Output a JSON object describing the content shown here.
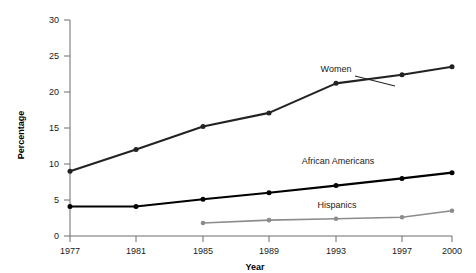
{
  "chart_data": {
    "type": "line",
    "title": "",
    "xlabel": "Year",
    "ylabel": "Percentage",
    "categories": [
      "1977",
      "1981",
      "1985",
      "1989",
      "1993",
      "1997",
      "2000"
    ],
    "x": [
      1977,
      1981,
      1985,
      1989,
      1993,
      1997,
      2000
    ],
    "xlim": [
      1977,
      2000
    ],
    "ylim": [
      0,
      30
    ],
    "yticks": [
      0,
      5,
      10,
      15,
      20,
      25,
      30
    ],
    "ytick_labels": [
      "0",
      "5",
      "10",
      "15",
      "20",
      "25",
      "30"
    ],
    "xtick_labels": [
      "1977",
      "1981",
      "1985",
      "1989",
      "1993",
      "1997",
      "2000"
    ],
    "grid": false,
    "legend_position": "inline-annotations",
    "series": [
      {
        "name": "Women",
        "color": "#222222",
        "values": [
          9.0,
          12.0,
          15.2,
          17.1,
          21.2,
          22.4,
          23.5
        ],
        "label_text": "Women"
      },
      {
        "name": "African Americans",
        "color": "#000000",
        "values": [
          4.1,
          4.1,
          5.1,
          6.0,
          7.0,
          8.0,
          8.8
        ],
        "label_text": "African Americans"
      },
      {
        "name": "Hispanics",
        "color": "#8c8c8c",
        "values": [
          null,
          null,
          1.8,
          2.2,
          2.4,
          2.6,
          3.5
        ],
        "label_text": "Hispanics"
      }
    ]
  },
  "axes": {
    "y_title": "Percentage",
    "x_title": "Year"
  },
  "colors": {
    "background": "#ffffff",
    "axis": "#6d6d6d",
    "women": "#222222",
    "african_americans": "#000000",
    "hispanics": "#8c8c8c",
    "text": "#1a1a1a"
  }
}
